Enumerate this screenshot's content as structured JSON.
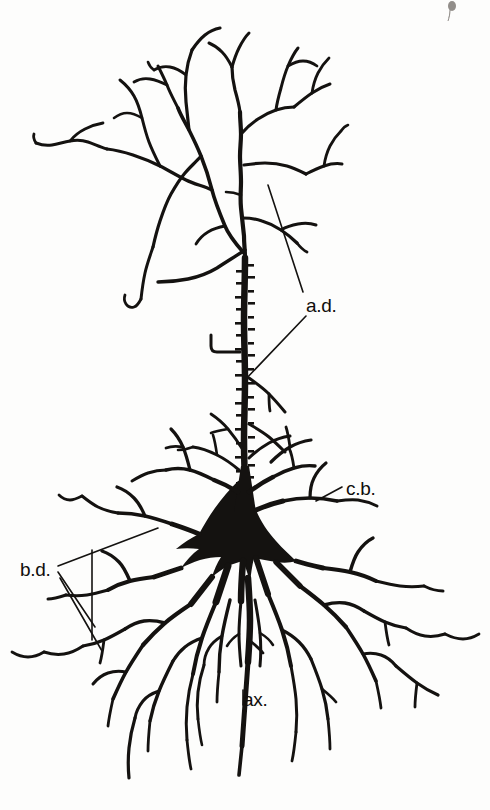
{
  "figure": {
    "style": "black ink line drawing on off-white paper",
    "background_color": "#fdfdfc",
    "ink_color": "#141210",
    "width": 490,
    "height": 810
  },
  "labels": {
    "apical_dendrite": {
      "text": "a.d.",
      "x": 306,
      "y": 305,
      "leader_count": 2,
      "meaning": "apical dendrite"
    },
    "cell_body": {
      "text": "c.b.",
      "x": 346,
      "y": 495,
      "leader_count": 1,
      "meaning": "cell body"
    },
    "basal_dendrites": {
      "text": "b.d.",
      "x": 22,
      "y": 576,
      "leader_count": 3,
      "meaning": "basal dendrites"
    },
    "axon": {
      "text": "ax.",
      "x": 243,
      "y": 703,
      "leader_count": 1,
      "meaning": "axon"
    }
  },
  "parts": [
    {
      "name": "apical-tuft",
      "description": "branching dendritic tuft at top"
    },
    {
      "name": "apical-dendrite-shaft",
      "description": "spiny vertical shaft"
    },
    {
      "name": "soma",
      "description": "solid triangular pyramidal cell body"
    },
    {
      "name": "basal-dendrite-field",
      "description": "radiating basal dendrites"
    },
    {
      "name": "axon",
      "description": "descending process from soma base"
    }
  ],
  "marks": {
    "corner_speck": {
      "x": 452,
      "y": 6,
      "description": "small ink speck top-right"
    }
  }
}
